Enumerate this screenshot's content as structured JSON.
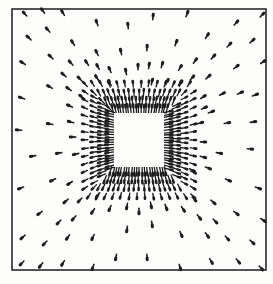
{
  "figure": {
    "type": "vector-field-diagram",
    "colors": {
      "background": "#fdfdfc",
      "ink": "#1e1e1e",
      "frame": "#2a2a2a"
    },
    "frame": {
      "x": 12,
      "y": 9,
      "width": 254,
      "height": 261,
      "stroke_width": 1.6
    },
    "center": {
      "x": 139,
      "y": 140
    },
    "inner_square": {
      "x": 113,
      "y": 112,
      "width": 52,
      "height": 56
    },
    "dense_ring": {
      "layers": [
        {
          "offset": 3,
          "spacing": 2.6,
          "length": 9,
          "width": 1.3
        },
        {
          "offset": 11,
          "spacing": 3.4,
          "length": 8,
          "width": 1.3
        },
        {
          "offset": 19,
          "spacing": 5.0,
          "length": 7,
          "width": 1.3
        },
        {
          "offset": 28,
          "spacing": 8.0,
          "length": 6,
          "width": 1.4
        }
      ]
    },
    "sparse_arrows": [
      [
        25,
        14
      ],
      [
        43,
        11
      ],
      [
        63,
        13
      ],
      [
        97,
        23
      ],
      [
        128,
        26
      ],
      [
        153,
        17
      ],
      [
        187,
        14
      ],
      [
        262,
        15
      ],
      [
        29,
        38
      ],
      [
        48,
        30
      ],
      [
        73,
        43
      ],
      [
        97,
        53
      ],
      [
        121,
        52
      ],
      [
        147,
        48
      ],
      [
        176,
        43
      ],
      [
        207,
        36
      ],
      [
        236,
        23
      ],
      [
        229,
        45
      ],
      [
        252,
        41
      ],
      [
        23,
        63
      ],
      [
        51,
        57
      ],
      [
        71,
        63
      ],
      [
        87,
        63
      ],
      [
        98,
        67
      ],
      [
        110,
        70
      ],
      [
        126,
        72
      ],
      [
        138,
        67
      ],
      [
        149,
        66
      ],
      [
        162,
        65
      ],
      [
        180,
        68
      ],
      [
        195,
        61
      ],
      [
        213,
        57
      ],
      [
        236,
        67
      ],
      [
        263,
        62
      ],
      [
        64,
        75
      ],
      [
        80,
        79
      ],
      [
        97,
        78
      ],
      [
        110,
        83
      ],
      [
        152,
        82
      ],
      [
        167,
        82
      ],
      [
        180,
        83
      ],
      [
        192,
        78
      ],
      [
        208,
        77
      ],
      [
        50,
        87
      ],
      [
        69,
        89
      ],
      [
        82,
        97
      ],
      [
        203,
        97
      ],
      [
        222,
        94
      ],
      [
        240,
        93
      ],
      [
        255,
        95
      ],
      [
        22,
        98
      ],
      [
        70,
        106
      ],
      [
        204,
        108
      ],
      [
        211,
        112
      ],
      [
        50,
        124
      ],
      [
        71,
        122
      ],
      [
        200,
        123
      ],
      [
        227,
        123
      ],
      [
        253,
        122
      ],
      [
        19,
        130
      ],
      [
        73,
        137
      ],
      [
        203,
        142
      ],
      [
        250,
        149
      ],
      [
        33,
        156
      ],
      [
        59,
        153
      ],
      [
        76,
        154
      ],
      [
        203,
        157
      ],
      [
        219,
        153
      ],
      [
        53,
        180
      ],
      [
        70,
        183
      ],
      [
        192,
        170
      ],
      [
        208,
        168
      ],
      [
        228,
        180
      ],
      [
        258,
        188
      ],
      [
        21,
        188
      ],
      [
        66,
        201
      ],
      [
        80,
        200
      ],
      [
        98,
        195
      ],
      [
        194,
        199
      ],
      [
        213,
        202
      ],
      [
        40,
        213
      ],
      [
        59,
        222
      ],
      [
        74,
        218
      ],
      [
        93,
        211
      ],
      [
        110,
        208
      ],
      [
        127,
        206
      ],
      [
        139,
        211
      ],
      [
        151,
        205
      ],
      [
        166,
        207
      ],
      [
        183,
        209
      ],
      [
        199,
        217
      ],
      [
        215,
        221
      ],
      [
        236,
        213
      ],
      [
        263,
        220
      ],
      [
        127,
        229
      ],
      [
        152,
        224
      ],
      [
        181,
        234
      ],
      [
        207,
        235
      ],
      [
        227,
        238
      ],
      [
        252,
        242
      ],
      [
        23,
        237
      ],
      [
        45,
        243
      ],
      [
        68,
        237
      ],
      [
        93,
        237
      ],
      [
        22,
        263
      ],
      [
        41,
        265
      ],
      [
        63,
        263
      ],
      [
        93,
        267
      ],
      [
        116,
        257
      ],
      [
        147,
        257
      ],
      [
        180,
        267
      ],
      [
        211,
        261
      ],
      [
        238,
        261
      ],
      [
        261,
        268
      ]
    ],
    "sparse_arrow_length": 5.5,
    "sparse_arrow_width": 1.6
  }
}
